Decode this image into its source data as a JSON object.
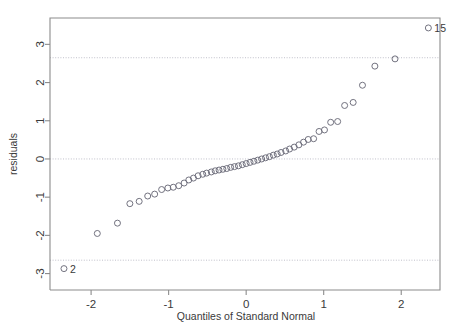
{
  "chart_data": {
    "type": "scatter",
    "title": "",
    "subtitle": "",
    "xlabel": "Quantiles of Standard Normal",
    "ylabel": "residuals",
    "xlim": [
      -2.53,
      2.5
    ],
    "ylim": [
      -3.43,
      3.69
    ],
    "xticks": [
      -2,
      -1,
      0,
      1,
      2
    ],
    "xticklabels": [
      "-2",
      "-1",
      "0",
      "1",
      "2"
    ],
    "yticks": [
      -3,
      -2,
      -1,
      0,
      1,
      2,
      3
    ],
    "yticklabels": [
      "-3",
      "-2",
      "-1",
      "0",
      "1",
      "2",
      "3"
    ],
    "grid": false,
    "legend": null,
    "reference_lines": [
      {
        "name": "zero-line",
        "orientation": "horizontal",
        "y": 0,
        "style": "dotted"
      },
      {
        "name": "upper-bound-line",
        "orientation": "horizontal",
        "y": 2.65,
        "style": "dotted"
      },
      {
        "name": "lower-bound-line",
        "orientation": "horizontal",
        "y": -2.65,
        "style": "dotted"
      }
    ],
    "marker": {
      "shape": "open-circle",
      "radius_px": 3
    },
    "series": [
      {
        "name": "residuals",
        "x": [
          -2.35,
          -1.92,
          -1.66,
          -1.5,
          -1.38,
          -1.27,
          -1.18,
          -1.09,
          -1.01,
          -0.94,
          -0.87,
          -0.8,
          -0.74,
          -0.68,
          -0.62,
          -0.56,
          -0.51,
          -0.45,
          -0.4,
          -0.35,
          -0.3,
          -0.25,
          -0.2,
          -0.15,
          -0.1,
          -0.05,
          0.0,
          0.05,
          0.1,
          0.15,
          0.2,
          0.25,
          0.3,
          0.35,
          0.4,
          0.45,
          0.51,
          0.56,
          0.62,
          0.68,
          0.74,
          0.8,
          0.87,
          0.94,
          1.01,
          1.09,
          1.18,
          1.27,
          1.38,
          1.5,
          1.66,
          1.92,
          2.35
        ],
        "y": [
          -2.87,
          -1.95,
          -1.68,
          -1.17,
          -1.11,
          -0.97,
          -0.92,
          -0.8,
          -0.76,
          -0.74,
          -0.7,
          -0.63,
          -0.55,
          -0.5,
          -0.44,
          -0.4,
          -0.37,
          -0.34,
          -0.31,
          -0.29,
          -0.27,
          -0.25,
          -0.22,
          -0.2,
          -0.18,
          -0.15,
          -0.12,
          -0.09,
          -0.06,
          -0.03,
          0.0,
          0.03,
          0.06,
          0.1,
          0.13,
          0.17,
          0.21,
          0.26,
          0.31,
          0.37,
          0.44,
          0.51,
          0.53,
          0.72,
          0.76,
          0.96,
          0.98,
          1.4,
          1.48,
          1.93,
          2.43,
          2.62,
          3.43
        ]
      }
    ],
    "annotations": [
      {
        "name": "outlier-label-15",
        "text": "15",
        "x": 2.35,
        "y": 3.43,
        "position": "right"
      },
      {
        "name": "outlier-label-2",
        "text": "2",
        "x": -2.35,
        "y": -2.87,
        "position": "right"
      }
    ]
  }
}
